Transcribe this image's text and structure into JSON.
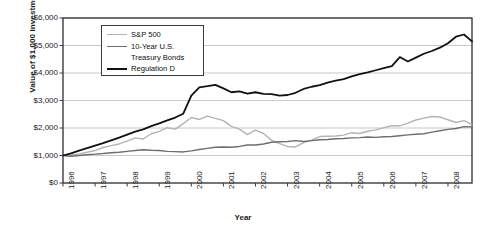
{
  "chart_data": {
    "type": "line",
    "title": "",
    "xlabel": "Year",
    "ylabel": "Value of $1,000 Investment",
    "xlim": [
      1996,
      2008.75
    ],
    "ylim": [
      0,
      6000
    ],
    "grid": true,
    "legend_position": "top-left-inside",
    "ytick_labels": [
      "$6,000",
      "$5,000",
      "$4,000",
      "$3,000",
      "$2,000",
      "$1,000",
      "$0"
    ],
    "ytick_values": [
      6000,
      5000,
      4000,
      3000,
      2000,
      1000,
      0
    ],
    "xtick_labels": [
      "1996",
      "1997",
      "1998",
      "1999",
      "2000",
      "2001",
      "2002",
      "2003",
      "2004",
      "2005",
      "2006",
      "2007",
      "2008"
    ],
    "xtick_values": [
      1996,
      1997,
      1998,
      1999,
      2000,
      2001,
      2002,
      2003,
      2004,
      2005,
      2006,
      2007,
      2008
    ],
    "colors": {
      "sp500": "#b4b4b4",
      "treasury": "#6e6e6e",
      "regulation_d": "#111111",
      "gridline": "#c8c8c8",
      "axis": "#3c3c3c",
      "background": "#ffffff"
    },
    "series": [
      {
        "name": "S&P 500",
        "color": "#b4b4b4",
        "x": [
          1996.0,
          1996.25,
          1996.5,
          1996.75,
          1997.0,
          1997.25,
          1997.5,
          1997.75,
          1998.0,
          1998.25,
          1998.5,
          1998.75,
          1999.0,
          1999.25,
          1999.5,
          1999.75,
          2000.0,
          2000.25,
          2000.5,
          2000.75,
          2001.0,
          2001.25,
          2001.5,
          2001.75,
          2002.0,
          2002.25,
          2002.5,
          2002.75,
          2003.0,
          2003.25,
          2003.5,
          2003.75,
          2004.0,
          2004.25,
          2004.5,
          2004.75,
          2005.0,
          2005.25,
          2005.5,
          2005.75,
          2006.0,
          2006.25,
          2006.5,
          2006.75,
          2007.0,
          2007.25,
          2007.5,
          2007.75,
          2008.0,
          2008.25,
          2008.5,
          2008.75
        ],
        "values": [
          1000,
          1010,
          1060,
          1120,
          1180,
          1290,
          1360,
          1420,
          1520,
          1640,
          1600,
          1790,
          1880,
          2010,
          1960,
          2160,
          2380,
          2310,
          2430,
          2350,
          2270,
          2060,
          1960,
          1760,
          1920,
          1800,
          1560,
          1430,
          1330,
          1310,
          1470,
          1560,
          1690,
          1700,
          1710,
          1740,
          1830,
          1800,
          1880,
          1930,
          2010,
          2080,
          2080,
          2180,
          2290,
          2360,
          2420,
          2400,
          2300,
          2200,
          2270,
          2120
        ]
      },
      {
        "name": "10-Year U.S. Treasury Bonds",
        "color": "#6e6e6e",
        "x": [
          1996.0,
          1996.25,
          1996.5,
          1996.75,
          1997.0,
          1997.25,
          1997.5,
          1997.75,
          1998.0,
          1998.25,
          1998.5,
          1998.75,
          1999.0,
          1999.25,
          1999.5,
          1999.75,
          2000.0,
          2000.25,
          2000.5,
          2000.75,
          2001.0,
          2001.25,
          2001.5,
          2001.75,
          2002.0,
          2002.25,
          2002.5,
          2002.75,
          2003.0,
          2003.25,
          2003.5,
          2003.75,
          2004.0,
          2004.25,
          2004.5,
          2004.75,
          2005.0,
          2005.25,
          2005.5,
          2005.75,
          2006.0,
          2006.25,
          2006.5,
          2006.75,
          2007.0,
          2007.25,
          2007.5,
          2007.75,
          2008.0,
          2008.25,
          2008.5,
          2008.75
        ],
        "values": [
          1000,
          975,
          1000,
          1030,
          1050,
          1070,
          1100,
          1120,
          1150,
          1180,
          1210,
          1190,
          1180,
          1150,
          1140,
          1130,
          1170,
          1220,
          1260,
          1300,
          1310,
          1300,
          1330,
          1380,
          1380,
          1420,
          1480,
          1500,
          1510,
          1540,
          1510,
          1540,
          1570,
          1580,
          1610,
          1620,
          1640,
          1650,
          1670,
          1660,
          1680,
          1690,
          1720,
          1750,
          1770,
          1790,
          1850,
          1900,
          1950,
          1980,
          2050,
          2040
        ]
      },
      {
        "name": "Regulation D",
        "color": "#111111",
        "x": [
          1996.0,
          1996.25,
          1996.5,
          1996.75,
          1997.0,
          1997.25,
          1997.5,
          1997.75,
          1998.0,
          1998.25,
          1998.5,
          1998.75,
          1999.0,
          1999.25,
          1999.5,
          1999.75,
          2000.0,
          2000.25,
          2000.5,
          2000.75,
          2001.0,
          2001.25,
          2001.5,
          2001.75,
          2002.0,
          2002.25,
          2002.5,
          2002.75,
          2003.0,
          2003.25,
          2003.5,
          2003.75,
          2004.0,
          2004.25,
          2004.5,
          2004.75,
          2005.0,
          2005.25,
          2005.5,
          2005.75,
          2006.0,
          2006.25,
          2006.5,
          2006.75,
          2007.0,
          2007.25,
          2007.5,
          2007.75,
          2008.0,
          2008.25,
          2008.5,
          2008.75
        ],
        "values": [
          1000,
          1080,
          1180,
          1270,
          1360,
          1450,
          1550,
          1650,
          1760,
          1870,
          1950,
          2070,
          2170,
          2280,
          2380,
          2520,
          3180,
          3480,
          3520,
          3570,
          3440,
          3300,
          3330,
          3250,
          3300,
          3240,
          3230,
          3180,
          3200,
          3280,
          3420,
          3500,
          3560,
          3650,
          3720,
          3780,
          3880,
          3960,
          4020,
          4100,
          4180,
          4250,
          4580,
          4420,
          4560,
          4700,
          4800,
          4920,
          5080,
          5320,
          5400,
          5150
        ]
      }
    ],
    "annotations": []
  },
  "legend": {
    "items": [
      {
        "label": "S&P 500"
      },
      {
        "label": "10-Year U.S."
      },
      {
        "label": "Treasury Bonds"
      },
      {
        "label": "Regulation D"
      }
    ]
  }
}
